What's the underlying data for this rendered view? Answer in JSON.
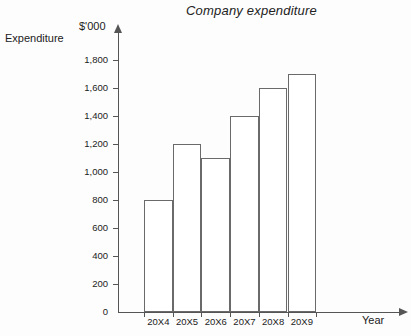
{
  "chart_data": {
    "type": "bar",
    "title": "Company expenditure",
    "xlabel": "Year",
    "ylabel": "Expenditure",
    "yunit": "$'000",
    "categories": [
      "20X4",
      "20X5",
      "20X6",
      "20X7",
      "20X8",
      "20X9"
    ],
    "values": [
      800,
      1200,
      1100,
      1400,
      1600,
      1700
    ],
    "ylim": [
      0,
      1800
    ],
    "ytick_step": 200,
    "ytick_labels": [
      "0",
      "200",
      "400",
      "600",
      "800",
      "1,000",
      "1,200",
      "1,400",
      "1,600",
      "1,800"
    ],
    "ytick_values": [
      0,
      200,
      400,
      600,
      800,
      1000,
      1200,
      1400,
      1600,
      1800
    ],
    "grid": false,
    "legend": null,
    "bar_fill_color": "#ffffff",
    "bar_edge_color": "#6a6a6a",
    "axis_color": "#555555",
    "background_color": "#fdfdfd",
    "title_style": "italic"
  }
}
